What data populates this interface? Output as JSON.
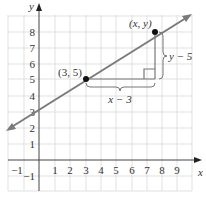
{
  "figure": {
    "axes": {
      "x_label": "x",
      "y_label": "y",
      "x_ticks": [
        "−1",
        "1",
        "2",
        "3",
        "4",
        "5",
        "6",
        "7",
        "8",
        "9"
      ],
      "y_ticks": [
        "−1",
        "1",
        "2",
        "3",
        "4",
        "5",
        "6",
        "7",
        "8"
      ]
    },
    "points": {
      "fixed": {
        "label": "(3, 5)",
        "x": 3,
        "y": 5
      },
      "variable": {
        "label": "(x, y)",
        "x": 7.5,
        "y": 8
      }
    },
    "annotations": {
      "horizontal": "x − 3",
      "vertical": "y − 5"
    },
    "colors": {
      "line": "#7a7a7a",
      "grid": "#d9d9d9",
      "axis": "#444444",
      "point": "#111111",
      "text": "#333333"
    }
  }
}
